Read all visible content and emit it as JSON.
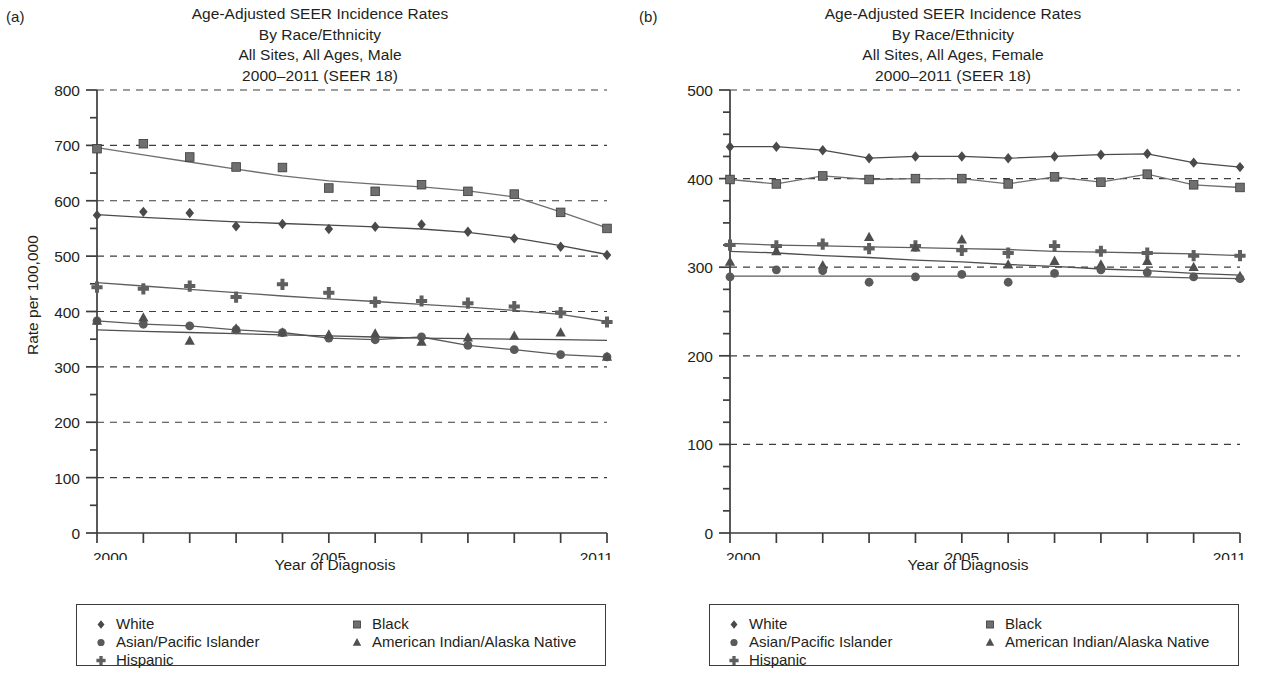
{
  "figure": {
    "background": "#ffffff",
    "ink": "#231f20"
  },
  "panels": [
    {
      "id": "a",
      "panel_label": "(a)",
      "title_lines": [
        "Age-Adjusted SEER Incidence Rates",
        "By Race/Ethnicity",
        "All Sites, All Ages, Male",
        "2000–2011 (SEER 18)"
      ],
      "xlabel": "Year of Diagnosis",
      "ylabel": "Rate per 100,000",
      "ytick_labels": [
        "0",
        "100",
        "200",
        "300",
        "400",
        "500",
        "600",
        "700",
        "800"
      ],
      "xtick_labels": [
        "2000",
        "2005",
        "2011"
      ]
    },
    {
      "id": "b",
      "panel_label": "(b)",
      "title_lines": [
        "Age-Adjusted SEER Incidence Rates",
        "By Race/Ethnicity",
        "All Sites, All Ages, Female",
        "2000–2011 (SEER 18)"
      ],
      "xlabel": "Year of Diagnosis",
      "ylabel": "Rate per 100,000",
      "ytick_labels": [
        "0",
        "100",
        "200",
        "300",
        "400",
        "500"
      ],
      "xtick_labels": [
        "2000",
        "2005",
        "2011"
      ]
    }
  ],
  "legend": {
    "entries": [
      {
        "label": "White",
        "marker": "diamond",
        "color": "#4a4a4a",
        "col": 0,
        "row": 0
      },
      {
        "label": "Black",
        "marker": "square",
        "color": "#6f6f6f",
        "col": 1,
        "row": 0
      },
      {
        "label": "Asian/Pacific Islander",
        "marker": "circle",
        "color": "#5a5a5a",
        "col": 0,
        "row": 1
      },
      {
        "label": "American Indian/Alaska Native",
        "marker": "triangle",
        "color": "#4f4f4f",
        "col": 1,
        "row": 1
      },
      {
        "label": "Hispanic",
        "marker": "plus",
        "color": "#5f5f5f",
        "col": 0,
        "row": 2
      }
    ]
  },
  "chart_data": [
    {
      "type": "line",
      "panel": "a",
      "title": "Age-Adjusted SEER Incidence Rates By Race/Ethnicity All Sites, All Ages, Male 2000–2011 (SEER 18)",
      "xlabel": "Year of Diagnosis",
      "ylabel": "Rate per 100,000",
      "x": [
        2000,
        2001,
        2002,
        2003,
        2004,
        2005,
        2006,
        2007,
        2008,
        2009,
        2010,
        2011
      ],
      "xlim": [
        2000,
        2011
      ],
      "ylim": [
        0,
        800
      ],
      "ytick_major": [
        0,
        100,
        200,
        300,
        400,
        500,
        600,
        700,
        800
      ],
      "ytick_minor_step": 50,
      "grid": "horizontal-dashed-at-majors",
      "legend_position": "below",
      "series": [
        {
          "name": "White",
          "marker": "diamond",
          "color": "#4a4a4a",
          "values": [
            574,
            580,
            578,
            554,
            558,
            549,
            553,
            557,
            544,
            532,
            517,
            502
          ],
          "trend": [
            575,
            570,
            566,
            562,
            559,
            556,
            553,
            549,
            543,
            533,
            519,
            503
          ]
        },
        {
          "name": "Black",
          "marker": "square",
          "color": "#6f6f6f",
          "values": [
            694,
            703,
            679,
            661,
            660,
            623,
            617,
            629,
            617,
            612,
            579,
            550
          ],
          "trend": [
            696,
            683,
            670,
            657,
            645,
            636,
            630,
            625,
            618,
            607,
            580,
            551
          ]
        },
        {
          "name": "Hispanic",
          "marker": "plus",
          "color": "#5f5f5f",
          "values": [
            444,
            441,
            446,
            426,
            449,
            434,
            417,
            419,
            415,
            409,
            398,
            381
          ],
          "trend": [
            452,
            446,
            440,
            434,
            428,
            423,
            418,
            413,
            408,
            402,
            395,
            382
          ]
        },
        {
          "name": "Asian/Pacific Islander",
          "marker": "circle",
          "color": "#5a5a5a",
          "values": [
            383,
            377,
            374,
            367,
            362,
            352,
            349,
            354,
            339,
            331,
            322,
            318
          ]
        },
        {
          "name": "American Indian/Alaska Native",
          "marker": "triangle",
          "color": "#4f4f4f",
          "values": [
            383,
            389,
            347,
            369,
            362,
            358,
            360,
            345,
            353,
            356,
            362,
            318
          ],
          "trend": [
            367,
            364,
            362,
            360,
            358,
            356,
            354,
            352,
            351,
            350,
            349,
            348
          ]
        }
      ]
    },
    {
      "type": "line",
      "panel": "b",
      "title": "Age-Adjusted SEER Incidence Rates By Race/Ethnicity All Sites, All Ages, Female 2000–2011 (SEER 18)",
      "xlabel": "Year of Diagnosis",
      "ylabel": "Rate per 100,000",
      "x": [
        2000,
        2001,
        2002,
        2003,
        2004,
        2005,
        2006,
        2007,
        2008,
        2009,
        2010,
        2011
      ],
      "xlim": [
        2000,
        2011
      ],
      "ylim": [
        0,
        500
      ],
      "ytick_major": [
        0,
        100,
        200,
        300,
        400,
        500
      ],
      "ytick_minor_step": 25,
      "grid": "horizontal-dashed-at-majors",
      "legend_position": "below",
      "series": [
        {
          "name": "White",
          "marker": "diamond",
          "color": "#4a4a4a",
          "values": [
            436,
            436,
            432,
            423,
            425,
            425,
            423,
            425,
            427,
            428,
            418,
            413
          ]
        },
        {
          "name": "Black",
          "marker": "square",
          "color": "#6f6f6f",
          "values": [
            399,
            394,
            403,
            399,
            400,
            400,
            394,
            402,
            396,
            405,
            393,
            390
          ]
        },
        {
          "name": "Hispanic",
          "marker": "plus",
          "color": "#5f5f5f",
          "values": [
            325,
            324,
            326,
            321,
            324,
            319,
            316,
            324,
            318,
            316,
            313,
            313
          ],
          "trend": [
            327,
            325,
            324,
            323,
            322,
            321,
            320,
            318,
            317,
            316,
            315,
            313
          ]
        },
        {
          "name": "American Indian/Alaska Native",
          "marker": "triangle",
          "color": "#4f4f4f",
          "values": [
            306,
            318,
            302,
            334,
            322,
            331,
            303,
            307,
            303,
            307,
            300,
            290
          ],
          "trend": [
            318,
            316,
            313,
            311,
            308,
            306,
            303,
            301,
            298,
            296,
            293,
            291
          ]
        },
        {
          "name": "Asian/Pacific Islander",
          "marker": "circle",
          "color": "#5a5a5a",
          "values": [
            289,
            297,
            296,
            283,
            289,
            292,
            283,
            293,
            297,
            294,
            289,
            287
          ],
          "trend": [
            290,
            290,
            290,
            290,
            290,
            290,
            290,
            290,
            290,
            289,
            288,
            287
          ]
        }
      ]
    }
  ]
}
